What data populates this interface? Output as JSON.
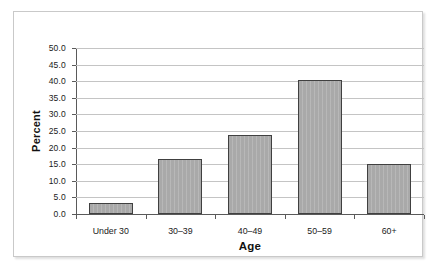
{
  "chart_data": {
    "type": "bar",
    "title": "",
    "xlabel": "Age",
    "ylabel": "Percent",
    "categories": [
      "Under 30",
      "30–39",
      "40–49",
      "50–59",
      "60+"
    ],
    "values": [
      3.2,
      16.5,
      23.7,
      40.3,
      15.1
    ],
    "ylim": [
      0.0,
      50.0
    ],
    "ytick_labels": [
      "0.0",
      "5.0",
      "10.0",
      "15.0",
      "20.0",
      "25.0",
      "30.0",
      "35.0",
      "40.0",
      "45.0",
      "50.0"
    ],
    "ytick_values": [
      0.0,
      5.0,
      10.0,
      15.0,
      20.0,
      25.0,
      30.0,
      35.0,
      40.0,
      45.0,
      50.0
    ],
    "grid": true,
    "legend": false,
    "legend_position": "none",
    "series": [
      {
        "name": "Percent",
        "values": [
          3.2,
          16.5,
          23.7,
          40.3,
          15.1
        ]
      }
    ],
    "colors": {
      "bar_fill": "#a9a9a9",
      "bar_border": "#404040",
      "gridline": "#c4c4c4",
      "axis": "#5a5a5a",
      "frame_border": "#c9c9c9",
      "background": "#ffffff",
      "text": "#1a1a1a"
    }
  }
}
